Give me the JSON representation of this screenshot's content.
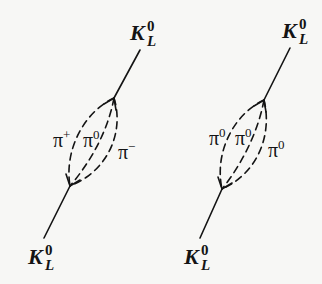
{
  "diagram": {
    "style": {
      "line_color": "#141414",
      "background": "#f7f7f5"
    },
    "diagrams": [
      {
        "id": "left",
        "description": "K_L^0 to pi+ pi0 pi- loop to K_L^0",
        "top_particle": {
          "base": "K",
          "sup": "0",
          "sub": "L"
        },
        "bottom_particle": {
          "base": "K",
          "sup": "0",
          "sub": "L"
        },
        "loop_particles": [
          {
            "base": "π",
            "sup": "+"
          },
          {
            "base": "π",
            "sup": "0"
          },
          {
            "base": "π",
            "sup": "−"
          }
        ],
        "geometry": {
          "top_end": [
            140,
            50
          ],
          "top_vertex": [
            114,
            98
          ],
          "bottom_vertex": [
            70,
            186
          ],
          "bottom_end": [
            44,
            238
          ]
        }
      },
      {
        "id": "right",
        "description": "K_L^0 to pi0 pi0 pi0 loop to K_L^0",
        "top_particle": {
          "base": "K",
          "sup": "0",
          "sub": "L"
        },
        "bottom_particle": {
          "base": "K",
          "sup": "0",
          "sub": "L"
        },
        "loop_particles": [
          {
            "base": "π",
            "sup": "0"
          },
          {
            "base": "π",
            "sup": "0"
          },
          {
            "base": "π",
            "sup": "0"
          }
        ],
        "geometry": {
          "top_end": [
            290,
            48
          ],
          "top_vertex": [
            264,
            100
          ],
          "bottom_vertex": [
            222,
            189
          ],
          "bottom_end": [
            200,
            238
          ]
        }
      }
    ]
  }
}
